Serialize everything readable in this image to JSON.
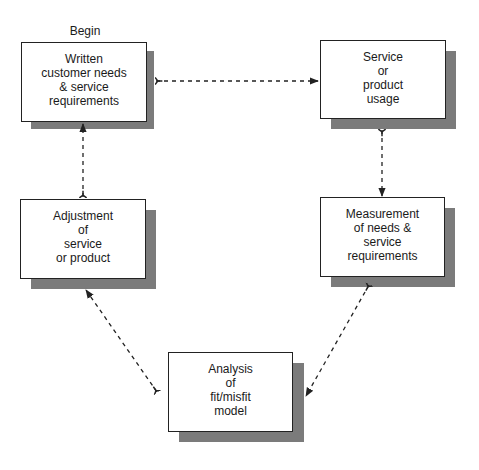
{
  "diagram": {
    "start_label": "Begin",
    "nodes": [
      {
        "id": "written-needs",
        "label": "Written\ncustomer needs\n& service\nrequirements",
        "x": 21,
        "y": 42,
        "w": 126,
        "h": 80
      },
      {
        "id": "usage",
        "label": "Service\nor\nproduct\nusage",
        "x": 320,
        "y": 40,
        "w": 126,
        "h": 79
      },
      {
        "id": "adjustment",
        "label": "Adjustment\nof\nservice\nor product",
        "x": 20,
        "y": 199,
        "w": 126,
        "h": 80
      },
      {
        "id": "measurement",
        "label": "Measurement\nof needs &\nservice\nrequirements",
        "x": 320,
        "y": 197,
        "w": 125,
        "h": 80
      },
      {
        "id": "analysis",
        "label": "Analysis\nof\nfit/misfit\nmodel",
        "x": 168,
        "y": 352,
        "w": 125,
        "h": 80
      }
    ],
    "edges": [
      {
        "from": "written-needs",
        "to": "usage",
        "style": "dashed"
      },
      {
        "from": "usage",
        "to": "measurement",
        "style": "dashed"
      },
      {
        "from": "measurement",
        "to": "analysis",
        "style": "dashed"
      },
      {
        "from": "analysis",
        "to": "adjustment",
        "style": "dashed"
      },
      {
        "from": "adjustment",
        "to": "written-needs",
        "style": "dashed"
      }
    ],
    "colors": {
      "shadow": "#7b7b7b",
      "border": "#222222",
      "arrow": "#222222"
    }
  }
}
